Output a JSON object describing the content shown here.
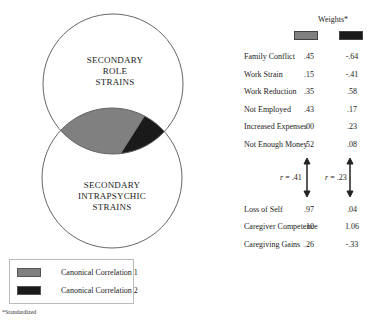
{
  "diagram": {
    "circles": [
      {
        "id": "role",
        "label_lines": [
          "SECONDARY",
          "ROLE",
          "STRAINS"
        ]
      },
      {
        "id": "intrapsychic",
        "label_lines": [
          "SECONDARY",
          "INTRAPSYCHIC",
          "STRAINS"
        ]
      }
    ],
    "colors": {
      "canonical_1": "#808080",
      "canonical_2": "#1a1a1a",
      "outline": "#666666"
    }
  },
  "weights": {
    "title": "Weights*",
    "role_strains": [
      {
        "label": "Family Conflict",
        "cc1": ".45",
        "cc2": "-.64"
      },
      {
        "label": "Work Strain",
        "cc1": ".15",
        "cc2": "-.41"
      },
      {
        "label": "Work Reduction",
        "cc1": ".35",
        "cc2": ".58"
      },
      {
        "label": "Not Employed",
        "cc1": ".43",
        "cc2": ".17"
      },
      {
        "label": "Increased Expenses",
        "cc1": ".00",
        "cc2": ".23"
      },
      {
        "label": "Not Enough Money",
        "cc1": ".52",
        "cc2": ".08"
      }
    ],
    "correlations": [
      {
        "r_symbol": "r",
        "value": " = .41"
      },
      {
        "r_symbol": "r",
        "value": " = .23"
      }
    ],
    "intrapsychic_strains": [
      {
        "label": "Loss of Self",
        "cc1": ".97",
        "cc2": ".04"
      },
      {
        "label": "Caregiver Competence",
        "cc1": ".10",
        "cc2": "1.06"
      },
      {
        "label": "Caregiving Gains",
        "cc1": ".26",
        "cc2": "-.33"
      }
    ]
  },
  "legend": {
    "items": [
      {
        "label": "Canonical Correlation 1",
        "color": "#808080"
      },
      {
        "label": "Canonical Correlation 2",
        "color": "#1a1a1a"
      }
    ]
  },
  "footnote": "*Standardized"
}
